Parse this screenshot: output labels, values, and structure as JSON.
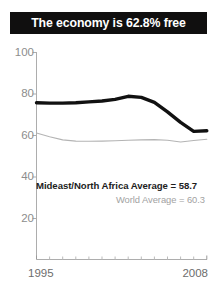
{
  "title": {
    "text": "The economy is 62.8% free",
    "background_color": "#100f0f",
    "text_color": "#ffffff"
  },
  "annotations": {
    "region_average": "Mideast/North Africa Average = 58.7",
    "world_average": "World Average = 60.3"
  },
  "axis": {
    "y_ticks": [
      "100",
      "80",
      "60",
      "40",
      "20"
    ],
    "x_start": "1995",
    "x_end": "2008"
  },
  "chart_data": {
    "type": "line",
    "title": "The economy is 62.8% free",
    "xlabel": "",
    "ylabel": "",
    "xlim": [
      1995,
      2008
    ],
    "ylim": [
      0,
      100
    ],
    "yticks": [
      20,
      40,
      60,
      80,
      100
    ],
    "xticks": [
      1995,
      2008
    ],
    "grid": false,
    "legend": "none",
    "x": [
      1995,
      1996,
      1997,
      1998,
      1999,
      2000,
      2001,
      2002,
      2003,
      2004,
      2005,
      2006,
      2007,
      2008
    ],
    "series": [
      {
        "name": "Mideast/North Africa",
        "color": "#111111",
        "width": 3.4,
        "values": [
          75.8,
          75.6,
          75.6,
          75.8,
          76.2,
          76.6,
          77.4,
          78.9,
          78.4,
          76.0,
          71.4,
          66.3,
          62.0,
          62.3
        ],
        "annotation": "Mideast/North Africa Average = 58.7",
        "average": 58.7
      },
      {
        "name": "World",
        "color": "#b4b4b4",
        "width": 1.1,
        "values": [
          61.2,
          59.4,
          57.9,
          57.3,
          57.2,
          57.3,
          57.5,
          57.7,
          57.9,
          58.0,
          57.7,
          56.9,
          57.6,
          58.2
        ],
        "annotation": "World Average = 60.3",
        "average": 60.3
      }
    ]
  }
}
